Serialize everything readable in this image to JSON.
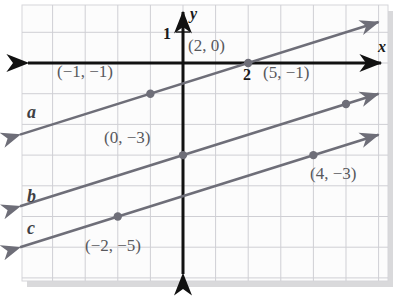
{
  "figure": {
    "kind": "coordinate-plane",
    "background": "#ffffff",
    "paper_color": "#fcfcfc",
    "grid_color": "#cfcfd4",
    "frame_color": "#d6d6da",
    "shadow_color": "#b9b9bd",
    "axis_color": "#111111",
    "line_color": "#6e6e78",
    "point_color": "#6e6e78",
    "label_color": "#58585c"
  },
  "axes": {
    "x_label": "x",
    "y_label": "y",
    "x_tick_label": "2",
    "y_tick_label": "1",
    "x_range": [
      -5,
      6
    ],
    "y_range": [
      -7.5,
      2
    ],
    "origin_px": {
      "x": 183,
      "y": 63
    },
    "unit_px": {
      "x": 32.6,
      "y": 30.7
    }
  },
  "chart_data": {
    "type": "line",
    "title": "",
    "xlabel": "x",
    "ylabel": "y",
    "xlim": [
      -5,
      6
    ],
    "ylim": [
      -7.5,
      2
    ],
    "grid": true,
    "legend": "inline-line-labels",
    "series": [
      {
        "name": "a",
        "slope": 0.3333,
        "intercept": -0.6667,
        "equation": "y = (1/3)x - 2/3",
        "label": "a",
        "points": [
          {
            "x": -1,
            "y": -1,
            "label": "(−1, −1)"
          },
          {
            "x": 2,
            "y": 0,
            "label": "(2, 0)"
          }
        ],
        "draw_from_x": -5.0,
        "draw_to_x": 6.0
      },
      {
        "name": "b",
        "slope": 0.3333,
        "intercept": -3,
        "equation": "y = (1/3)x - 3",
        "label": "b",
        "points": [
          {
            "x": 0,
            "y": -3,
            "label": "(0, −3)"
          },
          {
            "x": 5,
            "y": -1.3333,
            "label": "(5, −1)"
          }
        ],
        "draw_from_x": -5.0,
        "draw_to_x": 6.0
      },
      {
        "name": "c",
        "slope": 0.3333,
        "intercept": -4.3333,
        "equation": "y = (1/3)x - 13/3",
        "label": "c",
        "points": [
          {
            "x": -2,
            "y": -5,
            "label": "(−2, −5)"
          },
          {
            "x": 4,
            "y": -3,
            "label": "(4, −3)"
          }
        ],
        "draw_from_x": -5.0,
        "draw_to_x": 6.0
      }
    ]
  },
  "annotations": {
    "point_labels": [
      {
        "id": "p-neg1-neg1",
        "text": "(−1, −1)",
        "left": 57,
        "top": 62
      },
      {
        "id": "p-2-0",
        "text": "(2, 0)",
        "left": 188,
        "top": 36
      },
      {
        "id": "p-5-neg1",
        "text": "(5, −1)",
        "left": 263,
        "top": 63
      },
      {
        "id": "p-0-neg3",
        "text": "(0, −3)",
        "left": 104,
        "top": 128
      },
      {
        "id": "p-4-neg3",
        "text": "(4, −3)",
        "left": 310,
        "top": 164
      },
      {
        "id": "p-neg2-neg5",
        "text": "(−2, −5)",
        "left": 85,
        "top": 236
      }
    ],
    "line_labels": [
      {
        "id": "line-label-a",
        "text": "a",
        "left": 27,
        "top": 102
      },
      {
        "id": "line-label-b",
        "text": "b",
        "left": 27,
        "top": 186
      },
      {
        "id": "line-label-c",
        "text": "c",
        "left": 27,
        "top": 218
      }
    ],
    "axis_labels": [
      {
        "id": "axis-label-x",
        "text": "x",
        "left": 378,
        "top": 38
      },
      {
        "id": "axis-label-y",
        "text": "y",
        "left": 190,
        "top": 5
      }
    ],
    "tick_labels": [
      {
        "id": "tick-label-1",
        "text": "1",
        "left": 163,
        "top": 25
      },
      {
        "id": "tick-label-2",
        "text": "2",
        "left": 243,
        "top": 66
      }
    ]
  }
}
